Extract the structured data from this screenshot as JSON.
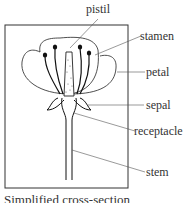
{
  "diagram": {
    "labels": {
      "pistil": "pistil",
      "stamen": "stamen",
      "petal": "petal",
      "sepal": "sepal",
      "receptacle": "receptacle",
      "stem": "stem"
    },
    "caption": "Simplified cross-section"
  }
}
